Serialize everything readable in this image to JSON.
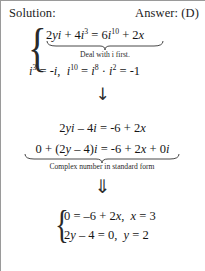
{
  "header": {
    "solution_label": "Solution:",
    "answer_label": "Answer: (D)"
  },
  "work": {
    "brace_open_glyph": "{",
    "step1": {
      "equation_parts": {
        "lhs_coef_y": "2",
        "lhs_var_y": "y",
        "lhs_i1": "i",
        "plus": "+",
        "lhs_coef_4": "4",
        "lhs_i2": "i",
        "lhs_exp_3": "3",
        "equals": "=",
        "rhs_coef_6": "6",
        "rhs_i": "i",
        "rhs_exp_10": "10",
        "plus2": "+",
        "rhs_coef_2": "2",
        "rhs_var_x": "x"
      },
      "equation_plain": "2yi + 4i^3 = 6i^10 + 2x",
      "caption": "Deal with i first."
    },
    "step2": {
      "equation_plain": "i^3 = -i,  i^10 = i^8 · i^2 = -1",
      "parts": {
        "i_a": "i",
        "exp_3": "3",
        "eq_a": "=",
        "neg_i": "-i",
        "comma": ",",
        "i_b": "i",
        "exp_10": "10",
        "eq_b": "=",
        "i_c": "i",
        "exp_8": "8",
        "dot": "·",
        "i_d": "i",
        "exp_2": "2",
        "eq_c": "=",
        "neg_one": "-1"
      }
    },
    "arrow_single": "↓",
    "step3": {
      "equation_plain": "2yi − 4i = -6 + 2x",
      "parts": {
        "c2": "2",
        "y": "y",
        "i1": "i",
        "minus": "–",
        "c4": "4",
        "i2": "i",
        "equals": "=",
        "neg6": "-6",
        "plus": "+",
        "c2b": "2",
        "x": "x"
      }
    },
    "step4": {
      "equation_plain": "0 + (2y − 4)i = -6 + 2x + 0i",
      "parts": {
        "zero": "0",
        "plus1": "+",
        "lparen": "(",
        "c2": "2",
        "y": "y",
        "minus": "–",
        "c4": "4",
        "rparen": ")",
        "i1": "i",
        "equals": "=",
        "neg6": "-6",
        "plus2": "+",
        "c2b": "2",
        "x": "x",
        "plus3": "+",
        "zero2": "0",
        "i2": "i"
      },
      "caption": "Complex number in standard form"
    },
    "arrow_double": "⇓",
    "result": {
      "brace_glyph": "{",
      "line1_plain": "0 = −6 + 2x,  x = 3",
      "line1": {
        "zero": "0",
        "eq1": "=",
        "neg6": "–6",
        "plus": "+",
        "c2": "2",
        "x": "x",
        "comma": ",",
        "x2": "x",
        "eq2": "=",
        "three": "3"
      },
      "line2_plain": "2y − 4 = 0,  y = 2",
      "line2": {
        "c2": "2",
        "y": "y",
        "minus": "–",
        "four": "4",
        "eq1": "=",
        "zero": "0",
        "comma": ",",
        "y2": "y",
        "eq2": "=",
        "two": "2"
      }
    }
  },
  "colors": {
    "ink": "#151515",
    "rule": "#9a9a9a",
    "page": "#ffffff"
  }
}
